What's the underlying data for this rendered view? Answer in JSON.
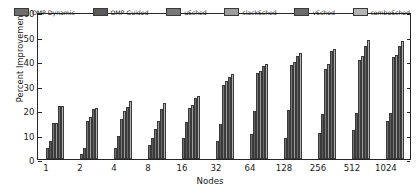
{
  "chart_data": {
    "type": "bar",
    "title": "",
    "xlabel": "Nodes",
    "ylabel": "Percent Improvement",
    "categories": [
      "1",
      "2",
      "4",
      "8",
      "16",
      "32",
      "64",
      "128",
      "256",
      "512",
      "1024"
    ],
    "ylim": [
      0,
      60
    ],
    "yticks": [
      0,
      10,
      20,
      30,
      40,
      50,
      60
    ],
    "grid": false,
    "legend_position": "upper center",
    "series": [
      {
        "name": "OMP-Dynamic",
        "color": "#6e6e6e",
        "values": [
          4.5,
          2.0,
          4.3,
          5.8,
          8.7,
          7.5,
          10.2,
          8.6,
          10.8,
          11.7,
          15.5
        ]
      },
      {
        "name": "OMP-Guided",
        "color": "#5a5a5a",
        "values": [
          7.4,
          4.6,
          9.4,
          8.4,
          15.0,
          14.1,
          19.4,
          20.1,
          18.3,
          18.8,
          18.9
        ]
      },
      {
        "name": "uSched",
        "color": "#787878",
        "values": [
          14.7,
          15.7,
          16.2,
          12.2,
          20.9,
          30.2,
          35.0,
          38.4,
          36.8,
          40.6,
          41.5
        ]
      },
      {
        "name": "slackSched",
        "color": "#9d9d9d",
        "values": [
          14.6,
          17.0,
          19.6,
          15.4,
          22.0,
          32.0,
          36.1,
          39.8,
          38.6,
          41.9,
          42.3
        ]
      },
      {
        "name": "vSched",
        "color": "#6b6b6b",
        "values": [
          21.6,
          20.4,
          21.3,
          20.6,
          24.9,
          33.4,
          37.8,
          42.0,
          43.9,
          46.1,
          46.3
        ]
      },
      {
        "name": "comboSched",
        "color": "#b4b4b4",
        "values": [
          21.5,
          21.0,
          23.7,
          22.8,
          25.8,
          34.9,
          38.8,
          43.2,
          44.9,
          48.6,
          48.2
        ]
      }
    ]
  }
}
